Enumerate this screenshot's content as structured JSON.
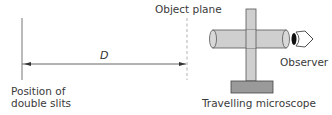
{
  "diagram": {
    "labels": {
      "object_plane": "Object plane",
      "distance": "D",
      "slits_line1": "Position of",
      "slits_line2": "double slits",
      "observer": "Observer",
      "microscope": "Travelling microscope"
    },
    "colors": {
      "line": "#555555",
      "tube_fill": "#cfcfcf",
      "base_fill": "#9a9a9a",
      "dashed_plane": "#bdbdbd",
      "eye": "#111111"
    }
  }
}
